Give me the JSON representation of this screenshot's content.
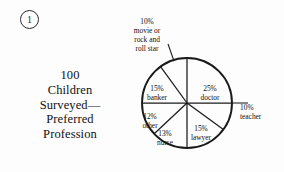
{
  "figure": {
    "marker_label": "1",
    "marker_icon": "circled-number-icon"
  },
  "caption": {
    "lines": [
      "100",
      "Children",
      "Surveyed—",
      "Preferred",
      "Profession"
    ]
  },
  "colors": {
    "background": "#fdfdfd",
    "ink": "#111111",
    "stroke": "#1a1a1a"
  },
  "chart_data": {
    "type": "pie",
    "units": "percent",
    "total": 100,
    "start_angle_deg": 0,
    "direction": "clockwise",
    "legend": "none",
    "grid": false,
    "categories": [
      "doctor",
      "teacher",
      "lawyer",
      "nurse",
      "other",
      "banker",
      "movie or rock and roll star"
    ],
    "values": [
      25,
      10,
      15,
      13,
      12,
      15,
      10
    ],
    "labels": [
      {
        "name": "doctor-slice",
        "percent_text": "25%",
        "name_lines": [
          "doctor"
        ],
        "value": 25,
        "placement": "inside"
      },
      {
        "name": "teacher-slice",
        "percent_text": "10%",
        "name_lines": [
          "teacher"
        ],
        "value": 10,
        "placement": "callout"
      },
      {
        "name": "lawyer-slice",
        "percent_text": "15%",
        "name_lines": [
          "lawyer"
        ],
        "value": 15,
        "placement": "inside"
      },
      {
        "name": "nurse-slice",
        "percent_text": "13%",
        "name_lines": [
          "nurse"
        ],
        "value": 13,
        "placement": "inside"
      },
      {
        "name": "other-slice",
        "percent_text": "12%",
        "name_lines": [
          "other"
        ],
        "value": 12,
        "placement": "inside"
      },
      {
        "name": "banker-slice",
        "percent_text": "15%",
        "name_lines": [
          "banker"
        ],
        "value": 15,
        "placement": "inside"
      },
      {
        "name": "movie-star-slice",
        "percent_text": "10%",
        "name_lines": [
          "movie or",
          "rock and",
          "roll star"
        ],
        "value": 10,
        "placement": "callout"
      }
    ]
  }
}
